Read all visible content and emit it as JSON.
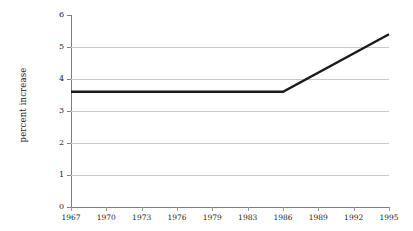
{
  "chart_data": {
    "type": "line",
    "title": "",
    "subtitle": "",
    "xlabel": "",
    "ylabel": "percent increase",
    "xlim": [
      1967,
      1995
    ],
    "ylim": [
      0,
      6
    ],
    "grid": true,
    "legend": false,
    "legend_position": "none",
    "x_tick_labels": [
      "1967",
      "1970",
      "1973",
      "1976",
      "1979",
      "1983",
      "1986",
      "1989",
      "1992",
      "1995"
    ],
    "x_tick_values": [
      1967,
      1970,
      1973,
      1976,
      1979,
      1983,
      1986,
      1989,
      1992,
      1995
    ],
    "y_tick_labels": [
      "0",
      "1",
      "2",
      "3",
      "4",
      "5",
      "6"
    ],
    "y_tick_values": [
      0,
      1,
      2,
      3,
      4,
      5,
      6
    ],
    "series": [
      {
        "name": "percent increase",
        "color": "#1a1a1a",
        "line_width": 2.4,
        "x": [
          1967,
          1986,
          1995
        ],
        "values": [
          3.6,
          3.6,
          5.4
        ]
      }
    ],
    "annotations": [],
    "colors": {
      "line": "#1a1a1a",
      "grid": "#c9c9c9",
      "axis": "#7d7d7d",
      "text": "#1a1a1a",
      "background": "#ffffff"
    }
  }
}
